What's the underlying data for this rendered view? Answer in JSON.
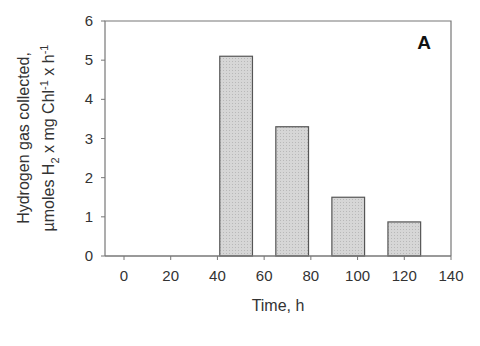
{
  "chart_data": {
    "type": "bar",
    "title": "",
    "panel_label": "A",
    "xlabel": "Time, h",
    "ylabel_line1": "Hydrogen gas collected,",
    "ylabel_line2": "µmoles H2 x mg Chl-1 x h-1",
    "x_ticks": [
      0,
      20,
      40,
      60,
      80,
      100,
      120,
      140
    ],
    "y_ticks": [
      0,
      1,
      2,
      3,
      4,
      5,
      6
    ],
    "xlim": [
      -8,
      140
    ],
    "ylim": [
      0,
      6
    ],
    "grid": false,
    "categories": [
      48,
      72,
      96,
      120
    ],
    "values": [
      5.1,
      3.3,
      1.5,
      0.87
    ],
    "bar_width_h": 14,
    "colors": {
      "bar_fill": "#d6d6d6",
      "bar_edge": "#555555",
      "axis": "#777777"
    }
  },
  "ylabel": {
    "line1": "Hydrogen gas collected,",
    "l2_a": "µmoles H",
    "l2_sub": "2",
    "l2_b": " x mg Chl",
    "l2_sup1": "-1",
    "l2_c": " x h",
    "l2_sup2": "-1"
  }
}
